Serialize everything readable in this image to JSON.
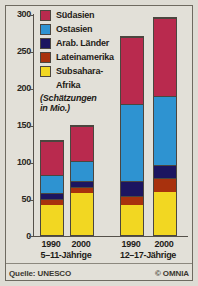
{
  "chart_data": {
    "type": "bar",
    "stacked": true,
    "title": "",
    "subtitle": "(Schätzungen in Mio.)",
    "xlabel": "",
    "ylabel": "",
    "ylim": [
      0,
      300
    ],
    "yticks": [
      0,
      50,
      100,
      150,
      200,
      250,
      300
    ],
    "ytick_labels": [
      "0",
      "50",
      "100",
      "150",
      "200",
      "250",
      "300"
    ],
    "grid": false,
    "legend_position": "top-left",
    "categories": [
      "1990",
      "2000",
      "1990",
      "2000"
    ],
    "groups": [
      {
        "label": "5–11-Jährige",
        "categories": [
          "1990",
          "2000"
        ]
      },
      {
        "label": "12–17-Jährige",
        "categories": [
          "1990",
          "2000"
        ]
      }
    ],
    "series": [
      {
        "name": "Subsahara-Afrika",
        "color": "#f2d722",
        "values": [
          41,
          58,
          41,
          59
        ]
      },
      {
        "name": "Lateinamerika",
        "color": "#a8310d",
        "values": [
          9,
          8,
          13,
          19
        ]
      },
      {
        "name": "Arab. Länder",
        "color": "#1c1560",
        "values": [
          8,
          8,
          20,
          18
        ]
      },
      {
        "name": "Ostasien",
        "color": "#2e93d1",
        "values": [
          25,
          28,
          106,
          94
        ]
      },
      {
        "name": "Südasien",
        "color": "#b92a4e",
        "values": [
          47,
          49,
          92,
          107
        ]
      }
    ],
    "totals": [
      130,
      151,
      272,
      297
    ]
  },
  "legend": {
    "items": [
      {
        "label": "Südasien",
        "color": "#b92a4e"
      },
      {
        "label": "Ostasien",
        "color": "#2e93d1"
      },
      {
        "label": "Arab. Länder",
        "color": "#1c1560"
      },
      {
        "label": "Lateinamerika",
        "color": "#a8310d"
      },
      {
        "label": "Subsahara-",
        "label2": "Afrika",
        "color": "#f2d722"
      }
    ],
    "note": "(Schätzungen",
    "note2": "in Mio.)"
  },
  "axis": {
    "y_labels": [
      "300",
      "250",
      "200",
      "150",
      "100",
      "50",
      "0"
    ]
  },
  "xaxis": {
    "years": [
      "1990",
      "2000",
      "1990",
      "2000"
    ],
    "group_labels": [
      "5–11-Jährige",
      "12–17-Jährige"
    ]
  },
  "footer": {
    "source": "Quelle: UNESCO",
    "copyright": "© OMNIA"
  }
}
